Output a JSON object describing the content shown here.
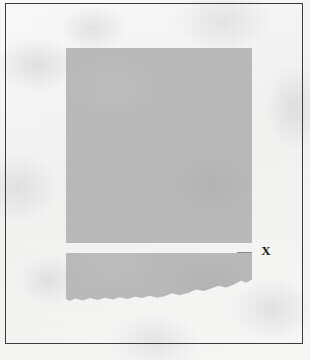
{
  "document": {
    "kind": "scanned-figure-page",
    "border_color": "#3b3b3b",
    "paper_color": "#f6f6f5"
  },
  "figure": {
    "block_fill_color": "#b9b9b9",
    "upper_block": {
      "name": "upper-gray-panel",
      "x": 66,
      "y": 48,
      "width": 186,
      "height": 195
    },
    "gap": {
      "name": "horizontal-white-gap",
      "y": 243,
      "height": 10
    },
    "lower_block": {
      "name": "lower-gray-panel",
      "x": 66,
      "y": 253,
      "width": 186,
      "height": 48,
      "bottom_edge": "ragged"
    },
    "tick_mark": {
      "name": "edge-tick-rule",
      "color": "#8a8a8a"
    }
  },
  "annotations": [
    {
      "id": "label-x",
      "label": "X",
      "x": 263,
      "y": 251,
      "points_to": "horizontal-white-gap"
    }
  ]
}
